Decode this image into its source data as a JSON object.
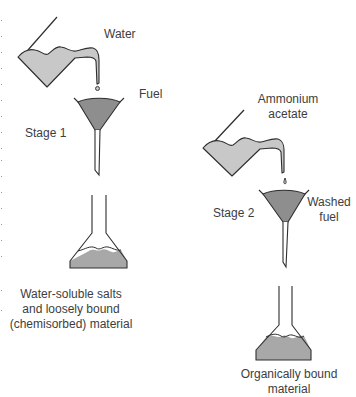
{
  "colors": {
    "liquid": "#c8c8c8",
    "fuel": "#8e8e8e",
    "outline": "#2e2e2e",
    "text": "#3d3d3d"
  },
  "stage1": {
    "stage_label": "Stage 1",
    "reagent_label": "Water",
    "solid_label": "Fuel",
    "result_lines": [
      "Water-soluble salts",
      "and loosely bound",
      "(chemisorbed) material"
    ]
  },
  "stage2": {
    "stage_label": "Stage 2",
    "reagent_lines": [
      "Ammonium",
      "acetate"
    ],
    "solid_lines": [
      "Washed",
      "fuel"
    ],
    "result_lines": [
      "Organically bound",
      "material"
    ]
  }
}
